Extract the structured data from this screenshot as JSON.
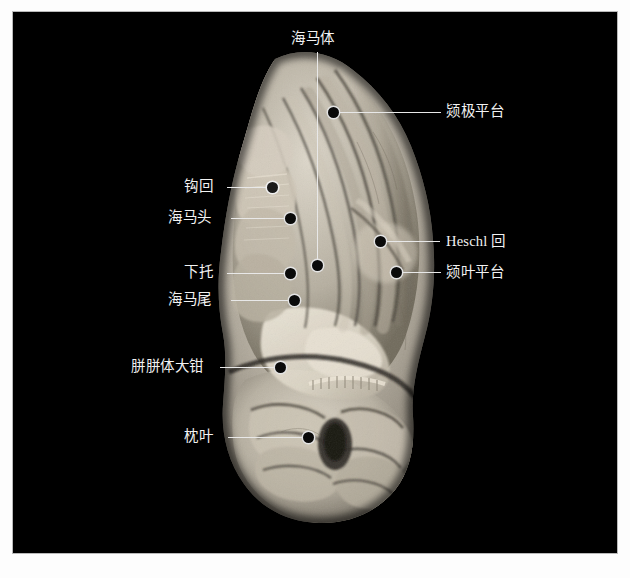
{
  "figure": {
    "background_color": "#000000",
    "page_color": "#fdfdfd",
    "border_color": "#b9b9b9",
    "label_color": "#f2f2f2",
    "leader_color": "#e8e8e8",
    "marker_color": "#0a0a0a",
    "specimen_caption": ""
  },
  "annotations": [
    {
      "id": "hippocampus",
      "label": "海马体",
      "side": "top",
      "marker": "filled",
      "label_x": 278,
      "label_y": 18,
      "dot_x": 304,
      "dot_y": 253
    },
    {
      "id": "temporal-pole-plateau",
      "label": "颎极平台",
      "side": "right",
      "marker": "filled",
      "label_x": 433,
      "label_y": 98,
      "dot_x": 320,
      "dot_y": 100
    },
    {
      "id": "uncus",
      "label": "钩回",
      "side": "left",
      "marker": "hollow",
      "label_x": 183,
      "label_y": 171,
      "dot_x": 259,
      "dot_y": 175
    },
    {
      "id": "hippocampal-head",
      "label": "海马头",
      "side": "left",
      "marker": "filled",
      "label_x": 169,
      "label_y": 201,
      "dot_x": 277,
      "dot_y": 206
    },
    {
      "id": "heschl-gyrus",
      "label": "Heschl 回",
      "side": "right",
      "marker": "filled",
      "label_x": 433,
      "label_y": 230,
      "dot_x": 367,
      "dot_y": 229
    },
    {
      "id": "subiculum",
      "label": "下托",
      "side": "left",
      "marker": "filled",
      "label_x": 183,
      "label_y": 257,
      "dot_x": 277,
      "dot_y": 261
    },
    {
      "id": "temporal-lobe-plateau",
      "label": "颎叶平台",
      "side": "right",
      "marker": "filled",
      "label_x": 433,
      "label_y": 261,
      "dot_x": 383,
      "dot_y": 260
    },
    {
      "id": "hippocampal-tail",
      "label": "海马尾",
      "side": "left",
      "marker": "filled",
      "label_x": 169,
      "label_y": 284,
      "dot_x": 281,
      "dot_y": 288
    },
    {
      "id": "forceps-major",
      "label": "胼胼体大钳",
      "side": "left",
      "marker": "filled",
      "label_x": 130,
      "label_y": 352,
      "dot_x": 267,
      "dot_y": 355
    },
    {
      "id": "occipital-lobe",
      "label": "枕叶",
      "side": "left",
      "marker": "filled",
      "label_x": 183,
      "label_y": 423,
      "dot_x": 295,
      "dot_y": 425
    }
  ]
}
